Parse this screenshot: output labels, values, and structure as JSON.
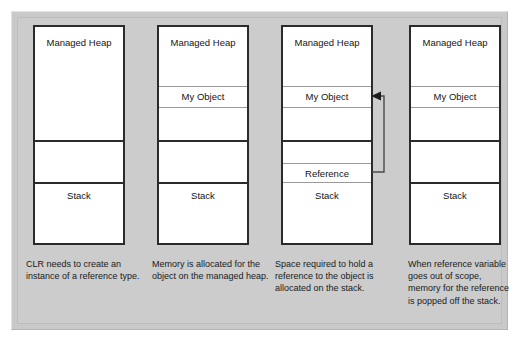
{
  "figure": {
    "background_color": "#cccccc",
    "panel_color": "#c9c9c9",
    "box_border_color": "#2b2b2b",
    "divider_color": "#9a9a9a",
    "text_color": "#141414"
  },
  "labels": {
    "managed_heap": "Managed Heap",
    "my_object": "My Object",
    "reference": "Reference",
    "stack": "Stack"
  },
  "columns": [
    {
      "id": "step-1",
      "heap_label": "Managed Heap",
      "object_label": "",
      "reference_label": "",
      "stack_label": "Stack",
      "caption": "CLR needs to create an instance of a reference type."
    },
    {
      "id": "step-2",
      "heap_label": "Managed Heap",
      "object_label": "My Object",
      "reference_label": "",
      "stack_label": "Stack",
      "caption": "Memory is allocated for the object on the managed heap."
    },
    {
      "id": "step-3",
      "heap_label": "Managed Heap",
      "object_label": "My Object",
      "reference_label": "Reference",
      "stack_label": "Stack",
      "caption": "Space required to hold a reference to the object is allocated on the stack."
    },
    {
      "id": "step-4",
      "heap_label": "Managed Heap",
      "object_label": "My Object",
      "reference_label": "",
      "stack_label": "Stack",
      "caption": "When reference variable goes out of scope, memory for the reference is popped off the stack."
    }
  ],
  "arrow": {
    "name": "reference-to-object-arrow",
    "from": "Reference",
    "to": "My Object",
    "direction": "left"
  }
}
